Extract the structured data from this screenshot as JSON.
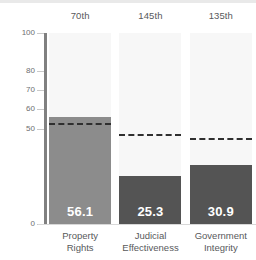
{
  "chart_data": {
    "type": "bar",
    "title": "",
    "subtitle": "",
    "xlabel": "",
    "ylabel": "",
    "ylim": [
      0,
      100
    ],
    "yticks": [
      100,
      80,
      70,
      60,
      50,
      0
    ],
    "ytick_labels": [
      "100",
      "80",
      "70",
      "60",
      "50",
      "0"
    ],
    "grid": false,
    "legend": "none",
    "categories": [
      "Property Rights",
      "Judicial Effectiveness",
      "Government Integrity"
    ],
    "values": [
      56.1,
      25.3,
      30.9
    ],
    "value_labels": [
      "56.1",
      "25.3",
      "30.9"
    ],
    "rank_labels": [
      "70th",
      "145th",
      "135th"
    ],
    "reference_lines": [
      52.0,
      46.0,
      44.0
    ],
    "annotations": [
      {
        "category": "Property Rights",
        "rank": "70th",
        "value": 56.1,
        "reference": 52.0
      },
      {
        "category": "Judicial Effectiveness",
        "rank": "145th",
        "value": 25.3,
        "reference": 46.0
      },
      {
        "category": "Government Integrity",
        "rank": "135th",
        "value": 30.9,
        "reference": 44.0
      }
    ],
    "colors": {
      "bar_primary": "#8c8c8c",
      "bar_secondary": "#545454",
      "column_background": "#f7f7f7",
      "axis": "#808080",
      "reference_line": "#2f2f2f",
      "value_text": "#ffffff",
      "label_text": "#58595b",
      "tick_text": "#6d6e70"
    },
    "bar_colors": [
      "#8c8c8c",
      "#545454",
      "#545454"
    ],
    "categories_lines": [
      [
        "Property",
        "Rights"
      ],
      [
        "Judicial",
        "Effectiveness"
      ],
      [
        "Government",
        "Integrity"
      ]
    ]
  }
}
